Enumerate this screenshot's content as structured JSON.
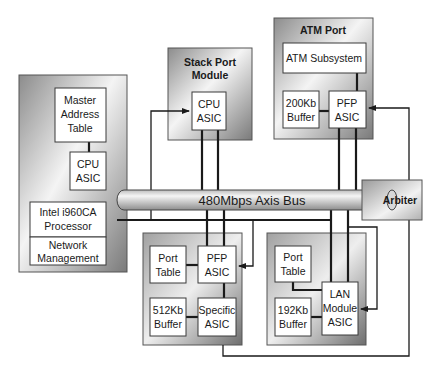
{
  "diagram": {
    "bus": {
      "label": "480Mbps Axis Bus"
    },
    "arbiter": {
      "label": "Arbiter"
    },
    "main_module": {
      "master_address_table": [
        "Master",
        "Address",
        "Table"
      ],
      "cpu_asic": [
        "CPU",
        "ASIC"
      ],
      "processor": [
        "Intel i960CA",
        "Processor"
      ],
      "network_management": [
        "Network",
        "Management"
      ]
    },
    "stack_port_module": {
      "title": [
        "Stack Port",
        "Module"
      ],
      "cpu_asic": [
        "CPU",
        "ASIC"
      ]
    },
    "atm_port": {
      "title": "ATM Port",
      "subsystem": "ATM Subsystem",
      "buffer": [
        "200Kb",
        "Buffer"
      ],
      "pfp_asic": [
        "PFP",
        "ASIC"
      ]
    },
    "port_module_a": {
      "port_table": [
        "Port",
        "Table"
      ],
      "pfp_asic": [
        "PFP",
        "ASIC"
      ],
      "buffer": [
        "512Kb",
        "Buffer"
      ],
      "specific_asic": [
        "Specific",
        "ASIC"
      ]
    },
    "lan_module": {
      "port_table": [
        "Port",
        "Table"
      ],
      "buffer": [
        "192Kb",
        "Buffer"
      ],
      "lan_asic": [
        "LAN",
        "Module",
        "ASIC"
      ]
    },
    "colors": {
      "module_dark": "#8a8a8a",
      "module_light": "#f2f2f2",
      "box_fill": "#ffffff",
      "line": "#1a1a1a"
    }
  }
}
